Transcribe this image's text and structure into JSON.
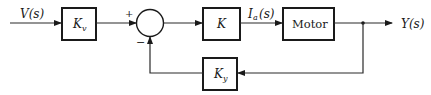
{
  "diagram": {
    "type": "block-diagram",
    "input_signal": {
      "label": "V(s)"
    },
    "output_signal": {
      "label": "Y(s)"
    },
    "blocks": [
      {
        "id": "kv",
        "label": "K",
        "subscript": "v"
      },
      {
        "id": "k",
        "label": "K",
        "subscript": ""
      },
      {
        "id": "motor",
        "label": "Motor",
        "subscript": ""
      },
      {
        "id": "ky",
        "label": "K",
        "subscript": "y"
      }
    ],
    "summing_junction": {
      "plus_sign": "+",
      "minus_sign": "−"
    },
    "intermediate_signals": [
      {
        "label": "I",
        "subscript": "a",
        "suffix": "(s)"
      }
    ],
    "connections": [
      "V(s) → Kv",
      "Kv → Σ (+)",
      "Σ → K",
      "K → Motor (Ia(s))",
      "Motor → Y(s)",
      "Y(s) → Ky (feedback)",
      "Ky → Σ (−)"
    ]
  }
}
